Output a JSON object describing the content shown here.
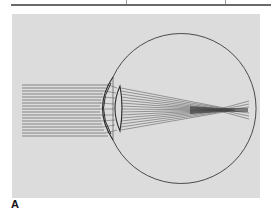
{
  "figure": {
    "panel_label": "A",
    "colors": {
      "background": "#dcdcdc",
      "outline": "#3a3a3a",
      "rays": "#5a5a5a",
      "rule": "#6a6a6a"
    },
    "ray_count": 18
  }
}
